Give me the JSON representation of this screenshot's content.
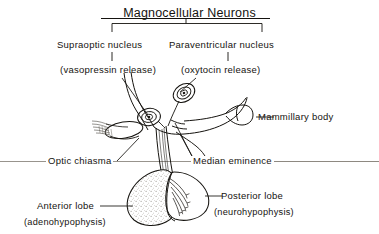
{
  "figure": {
    "title": "Magnocellular Neurons",
    "style": {
      "ink": "#15130f",
      "paper": "#ffffff",
      "stipple": "#b9b4ab",
      "rule": "#8c8880"
    }
  },
  "labels": {
    "title": "Magnocellular Neurons",
    "supraoptic_nucleus": "Supraoptic nucleus",
    "vasopressin_release": "(vasopressin release)",
    "paraventricular_nucleus": "Paraventricular nucleus",
    "oxytocin_release": "(oxytocin release)",
    "mammillary_body": "Mammillary body",
    "optic_chiasma": "Optic chiasma",
    "median_eminence": "Median eminence",
    "anterior_lobe": "Anterior lobe",
    "adenohypophysis": "(adenohypophysis)",
    "posterior_lobe": "Posterior lobe",
    "neurohypophysis": "(neurohypophysis)"
  },
  "structures": [
    {
      "name": "supraoptic-nucleus-neuron",
      "note": "magnocellular soma with nucleus, left"
    },
    {
      "name": "paraventricular-nucleus-neuron",
      "note": "magnocellular soma with nucleus, upper right"
    },
    {
      "name": "optic-chiasma",
      "note": "oval crossing of optic nerves, left of stalk"
    },
    {
      "name": "mammillary-body",
      "note": "rounded eminence, right of stalk"
    },
    {
      "name": "median-eminence",
      "note": "top of infundibular stalk"
    },
    {
      "name": "infundibular-stalk",
      "note": "axon tract descending to pituitary"
    },
    {
      "name": "anterior-lobe",
      "note": "stippled adenohypophysis, left lobe"
    },
    {
      "name": "posterior-lobe",
      "note": "clear neurohypophysis with axon terminals, right lobe"
    }
  ]
}
